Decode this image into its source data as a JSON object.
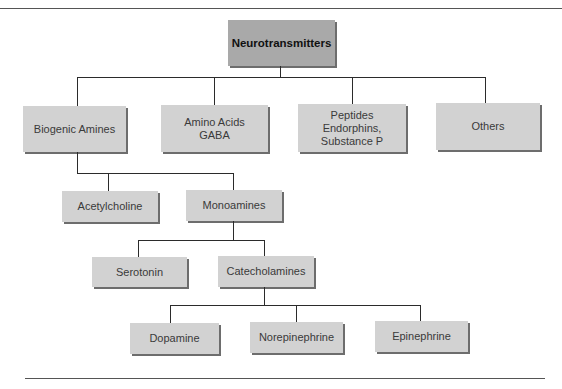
{
  "diagram": {
    "title": "Neurotransmitters",
    "colors": {
      "root_fill": "#a9a9a9",
      "node_fill": "#d2d2d2",
      "shadow": "#6d6d6d",
      "line": "#2b2b2b"
    },
    "level1": [
      {
        "label": "Biogenic Amines"
      },
      {
        "label": "Amino Acids\nGABA"
      },
      {
        "label": "Peptides\nEndorphins,\nSubstance P"
      },
      {
        "label": "Others"
      }
    ],
    "biogenic_children": [
      {
        "label": "Acetylcholine"
      },
      {
        "label": "Monoamines"
      }
    ],
    "monoamine_children": [
      {
        "label": "Serotonin"
      },
      {
        "label": "Catecholamines"
      }
    ],
    "catecholamine_children": [
      {
        "label": "Dopamine"
      },
      {
        "label": "Norepinephrine"
      },
      {
        "label": "Epinephrine"
      }
    ]
  }
}
